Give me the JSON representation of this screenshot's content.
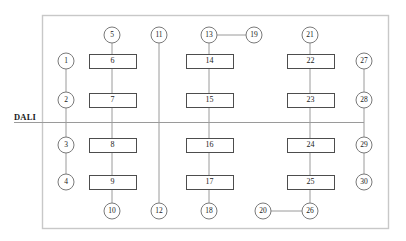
{
  "diagram": {
    "bus_label": "DALI",
    "colors": {
      "frame": "#c8c8c8",
      "node_stroke": "#7a7a7a",
      "node_fill": "#ffffff",
      "box_stroke": "#4d4d4d",
      "box_fill": "#ffffff",
      "link": "#9a9a9a",
      "bus_line": "#9a9a9a",
      "text": "#1a1a1a",
      "background": "#ffffff"
    },
    "frame": {
      "x": 42,
      "y": 15,
      "width": 346,
      "height": 213
    },
    "bus": {
      "y": 122,
      "x_start": 14,
      "x_end": 364,
      "label_x": 14,
      "label_y": 113
    },
    "circles": [
      {
        "id": "1",
        "label": "1",
        "cx": 66,
        "cy": 61,
        "r": 8
      },
      {
        "id": "2",
        "label": "2",
        "cx": 66,
        "cy": 100,
        "r": 8
      },
      {
        "id": "3",
        "label": "3",
        "cx": 66,
        "cy": 145,
        "r": 8
      },
      {
        "id": "4",
        "label": "4",
        "cx": 66,
        "cy": 182,
        "r": 8
      },
      {
        "id": "5",
        "label": "5",
        "cx": 112,
        "cy": 35,
        "r": 8
      },
      {
        "id": "10",
        "label": "10",
        "cx": 112,
        "cy": 211,
        "r": 8
      },
      {
        "id": "11",
        "label": "11",
        "cx": 159,
        "cy": 35,
        "r": 8
      },
      {
        "id": "12",
        "label": "12",
        "cx": 159,
        "cy": 211,
        "r": 8
      },
      {
        "id": "13",
        "label": "13",
        "cx": 209,
        "cy": 35,
        "r": 8
      },
      {
        "id": "19",
        "label": "19",
        "cx": 254,
        "cy": 35,
        "r": 8
      },
      {
        "id": "18",
        "label": "18",
        "cx": 209,
        "cy": 211,
        "r": 8
      },
      {
        "id": "21",
        "label": "21",
        "cx": 310,
        "cy": 35,
        "r": 8
      },
      {
        "id": "20",
        "label": "20",
        "cx": 263,
        "cy": 211,
        "r": 8
      },
      {
        "id": "26",
        "label": "26",
        "cx": 310,
        "cy": 211,
        "r": 8
      },
      {
        "id": "27",
        "label": "27",
        "cx": 364,
        "cy": 61,
        "r": 8
      },
      {
        "id": "28",
        "label": "28",
        "cx": 364,
        "cy": 100,
        "r": 8
      },
      {
        "id": "29",
        "label": "29",
        "cx": 364,
        "cy": 145,
        "r": 8
      },
      {
        "id": "30",
        "label": "30",
        "cx": 364,
        "cy": 182,
        "r": 8
      }
    ],
    "boxes": [
      {
        "id": "6",
        "label": "6",
        "x": 89,
        "y": 54,
        "width": 47,
        "height": 14
      },
      {
        "id": "7",
        "label": "7",
        "x": 89,
        "y": 93,
        "width": 47,
        "height": 14
      },
      {
        "id": "8",
        "label": "8",
        "x": 89,
        "y": 138,
        "width": 47,
        "height": 14
      },
      {
        "id": "9",
        "label": "9",
        "x": 89,
        "y": 175,
        "width": 47,
        "height": 14
      },
      {
        "id": "14",
        "label": "14",
        "x": 186,
        "y": 54,
        "width": 47,
        "height": 14
      },
      {
        "id": "15",
        "label": "15",
        "x": 186,
        "y": 93,
        "width": 47,
        "height": 14
      },
      {
        "id": "16",
        "label": "16",
        "x": 186,
        "y": 138,
        "width": 47,
        "height": 14
      },
      {
        "id": "17",
        "label": "17",
        "x": 186,
        "y": 175,
        "width": 47,
        "height": 14
      },
      {
        "id": "22",
        "label": "22",
        "x": 287,
        "y": 54,
        "width": 47,
        "height": 14
      },
      {
        "id": "23",
        "label": "23",
        "x": 287,
        "y": 93,
        "width": 47,
        "height": 14
      },
      {
        "id": "24",
        "label": "24",
        "x": 287,
        "y": 138,
        "width": 47,
        "height": 14
      },
      {
        "id": "25",
        "label": "25",
        "x": 287,
        "y": 175,
        "width": 47,
        "height": 14
      }
    ],
    "links": [
      {
        "from": "1",
        "to": "2",
        "x1": 66,
        "y1": 69,
        "x2": 66,
        "y2": 92
      },
      {
        "from": "2",
        "to": "3",
        "x1": 66,
        "y1": 108,
        "x2": 66,
        "y2": 137
      },
      {
        "from": "3",
        "to": "4",
        "x1": 66,
        "y1": 153,
        "x2": 66,
        "y2": 174
      },
      {
        "from": "5",
        "to": "6",
        "x1": 112,
        "y1": 43,
        "x2": 112,
        "y2": 54
      },
      {
        "from": "6",
        "to": "7",
        "x1": 112,
        "y1": 68,
        "x2": 112,
        "y2": 93
      },
      {
        "from": "7",
        "to": "8",
        "x1": 112,
        "y1": 107,
        "x2": 112,
        "y2": 138
      },
      {
        "from": "8",
        "to": "9",
        "x1": 112,
        "y1": 152,
        "x2": 112,
        "y2": 175
      },
      {
        "from": "9",
        "to": "10",
        "x1": 112,
        "y1": 189,
        "x2": 112,
        "y2": 203
      },
      {
        "from": "11",
        "to": "12",
        "x1": 159,
        "y1": 43,
        "x2": 159,
        "y2": 203
      },
      {
        "from": "13",
        "to": "19",
        "x1": 217,
        "y1": 35,
        "x2": 246,
        "y2": 35
      },
      {
        "from": "13",
        "to": "14",
        "x1": 209,
        "y1": 43,
        "x2": 209,
        "y2": 54
      },
      {
        "from": "14",
        "to": "15",
        "x1": 209,
        "y1": 68,
        "x2": 209,
        "y2": 93
      },
      {
        "from": "15",
        "to": "16",
        "x1": 209,
        "y1": 107,
        "x2": 209,
        "y2": 138
      },
      {
        "from": "16",
        "to": "17",
        "x1": 209,
        "y1": 152,
        "x2": 209,
        "y2": 175
      },
      {
        "from": "17",
        "to": "18",
        "x1": 209,
        "y1": 189,
        "x2": 209,
        "y2": 203
      },
      {
        "from": "21",
        "to": "22",
        "x1": 310,
        "y1": 43,
        "x2": 310,
        "y2": 54
      },
      {
        "from": "22",
        "to": "23",
        "x1": 310,
        "y1": 68,
        "x2": 310,
        "y2": 93
      },
      {
        "from": "23",
        "to": "24",
        "x1": 310,
        "y1": 107,
        "x2": 310,
        "y2": 138
      },
      {
        "from": "24",
        "to": "25",
        "x1": 310,
        "y1": 152,
        "x2": 310,
        "y2": 175
      },
      {
        "from": "25",
        "to": "26",
        "x1": 310,
        "y1": 189,
        "x2": 310,
        "y2": 203
      },
      {
        "from": "20",
        "to": "26",
        "x1": 271,
        "y1": 211,
        "x2": 302,
        "y2": 211
      },
      {
        "from": "27",
        "to": "28",
        "x1": 364,
        "y1": 69,
        "x2": 364,
        "y2": 92
      },
      {
        "from": "28",
        "to": "29",
        "x1": 364,
        "y1": 108,
        "x2": 364,
        "y2": 137
      },
      {
        "from": "29",
        "to": "30",
        "x1": 364,
        "y1": 153,
        "x2": 364,
        "y2": 174
      }
    ]
  }
}
